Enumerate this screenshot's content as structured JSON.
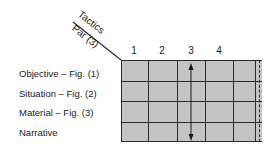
{
  "header": {
    "top_label": "Tactics",
    "bottom_label": "Par (3)"
  },
  "columns": [
    "1",
    "2",
    "3",
    "4"
  ],
  "rows": [
    {
      "label": "Objective – Fig. (1)"
    },
    {
      "label": "Situation – Fig. (2)"
    },
    {
      "label": "Material – Fig. (3)"
    },
    {
      "label": "Narrative"
    }
  ],
  "annotations": {
    "arrow": "double-headed vertical arrow in column 3 spanning all rows"
  },
  "colors": {
    "cell_fill": "#c4c4c4",
    "line": "#2a2a2a"
  }
}
